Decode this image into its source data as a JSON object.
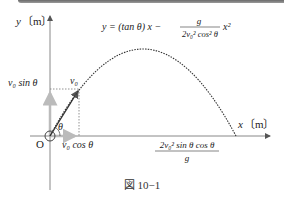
{
  "figure": {
    "caption": "図 10−1",
    "y_axis_label_var": "y",
    "y_axis_label_unit": "〔m〕",
    "x_axis_label_var": "x",
    "x_axis_label_unit": "〔m〕",
    "origin_label": "O",
    "equation": {
      "lhs": "y = (tan θ) x −",
      "numerator": "g",
      "denominator": "2v₀² cos² θ",
      "tail": "x²"
    },
    "velocity_label": "v₀",
    "vy_label": "v₀ sin θ",
    "vx_label": "v₀ cos θ",
    "angle_label": "θ",
    "range_label": {
      "numerator": "2v₀² sin θ cos θ",
      "denominator": "g"
    },
    "colors": {
      "axis": "#888888",
      "trajectory": "#333333",
      "component_arrow": "#bbbbbb",
      "topbar": "#7a7a7a"
    }
  }
}
